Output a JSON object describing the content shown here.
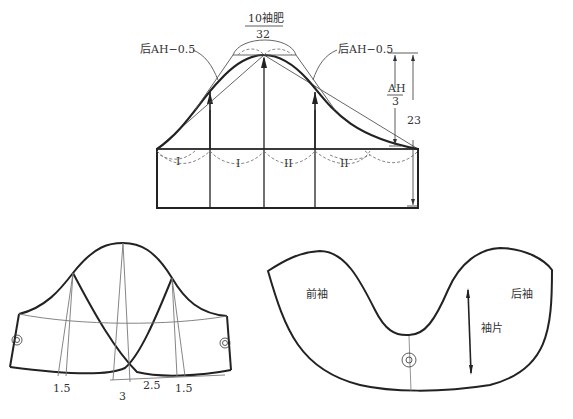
{
  "diagram": {
    "top": {
      "label_top": "10袖肥",
      "label_width": "32",
      "label_left": "后AH−0.5",
      "label_right": "后AH−0.5",
      "dim_ah_num": "AH",
      "dim_ah_den": "3",
      "dim_height": "23",
      "mark_1": "I",
      "mark_2": "I",
      "mark_3": "II",
      "mark_4": "II"
    },
    "bottom_left": {
      "dim_left": "1.5",
      "dim_center": "3",
      "dim_center_right": "2.5",
      "dim_right": "1.5"
    },
    "bottom_right": {
      "label_front": "前袖",
      "label_back": "后袖",
      "label_piece": "袖片"
    },
    "colors": {
      "line": "#222222",
      "thin": "#555555",
      "dashed": "#777777",
      "background": "#ffffff"
    }
  }
}
